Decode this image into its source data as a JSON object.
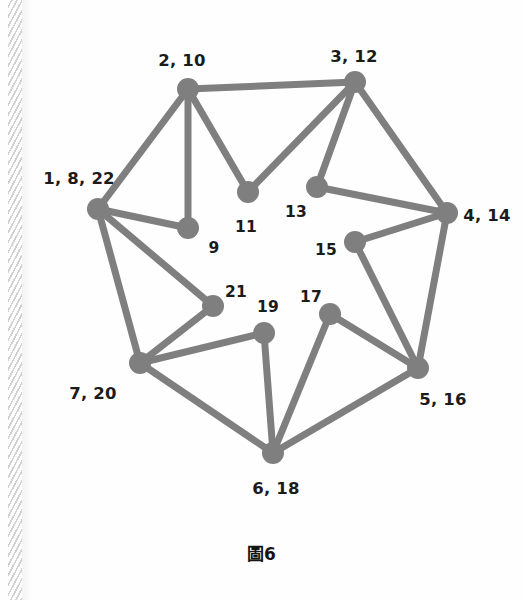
{
  "page": {
    "background_color": "#fefefe",
    "binding_color": "#c9c9c9",
    "has_left_binding_strip": true
  },
  "figure": {
    "caption_symbol": "圖",
    "caption_number": "6",
    "caption_full": "圖6",
    "node_color": "#7f7f7f",
    "edge_color": "#7f7f7f",
    "label_color": "#1b1b1b"
  },
  "chart_data": {
    "type": "diagram",
    "subtype": "node-link-graph",
    "title": "圖6",
    "node_radius": 11,
    "edge_width": 7,
    "node_color": "#7f7f7f",
    "edge_color": "#7f7f7f",
    "nodes": [
      {
        "id": "n1",
        "label": "1, 8, 22",
        "x": 98,
        "y": 209,
        "label_x": 79,
        "label_y": 179,
        "label_size": "big"
      },
      {
        "id": "n2",
        "label": "2, 10",
        "x": 188,
        "y": 89,
        "label_x": 182,
        "label_y": 61,
        "label_size": "big"
      },
      {
        "id": "n3",
        "label": "3, 12",
        "x": 355,
        "y": 82,
        "label_x": 354,
        "label_y": 57,
        "label_size": "big"
      },
      {
        "id": "n4",
        "label": "4, 14",
        "x": 447,
        "y": 213,
        "label_x": 487,
        "label_y": 216,
        "label_size": "big"
      },
      {
        "id": "n5",
        "label": "5, 16",
        "x": 418,
        "y": 368,
        "label_x": 443,
        "label_y": 400,
        "label_size": "big"
      },
      {
        "id": "n6",
        "label": "6, 18",
        "x": 273,
        "y": 453,
        "label_x": 276,
        "label_y": 489,
        "label_size": "big"
      },
      {
        "id": "n7",
        "label": "7, 20",
        "x": 140,
        "y": 363,
        "label_x": 93,
        "label_y": 394,
        "label_size": "big"
      },
      {
        "id": "n9",
        "label": "9",
        "x": 188,
        "y": 228,
        "label_x": 214,
        "label_y": 249,
        "label_size": "small"
      },
      {
        "id": "n11",
        "label": "11",
        "x": 248,
        "y": 192,
        "label_x": 246,
        "label_y": 228,
        "label_size": "small"
      },
      {
        "id": "n13",
        "label": "13",
        "x": 317,
        "y": 187,
        "label_x": 296,
        "label_y": 213,
        "label_size": "small"
      },
      {
        "id": "n15",
        "label": "15",
        "x": 355,
        "y": 242,
        "label_x": 326,
        "label_y": 251,
        "label_size": "small"
      },
      {
        "id": "n17",
        "label": "17",
        "x": 330,
        "y": 314,
        "label_x": 311,
        "label_y": 298,
        "label_size": "small"
      },
      {
        "id": "n19",
        "label": "19",
        "x": 264,
        "y": 333,
        "label_x": 268,
        "label_y": 308,
        "label_size": "small"
      },
      {
        "id": "n21",
        "label": "21",
        "x": 213,
        "y": 306,
        "label_x": 236,
        "label_y": 293,
        "label_size": "small"
      }
    ],
    "edges": [
      [
        "n2",
        "n3"
      ],
      [
        "n2",
        "n1"
      ],
      [
        "n2",
        "n9"
      ],
      [
        "n2",
        "n11"
      ],
      [
        "n3",
        "n11"
      ],
      [
        "n3",
        "n13"
      ],
      [
        "n3",
        "n4"
      ],
      [
        "n13",
        "n4"
      ],
      [
        "n15",
        "n4"
      ],
      [
        "n4",
        "n5"
      ],
      [
        "n15",
        "n5"
      ],
      [
        "n17",
        "n5"
      ],
      [
        "n5",
        "n6"
      ],
      [
        "n17",
        "n6"
      ],
      [
        "n19",
        "n6"
      ],
      [
        "n7",
        "n6"
      ],
      [
        "n19",
        "n7"
      ],
      [
        "n21",
        "n7"
      ],
      [
        "n1",
        "n7"
      ],
      [
        "n1",
        "n21"
      ],
      [
        "n1",
        "n9"
      ]
    ]
  }
}
